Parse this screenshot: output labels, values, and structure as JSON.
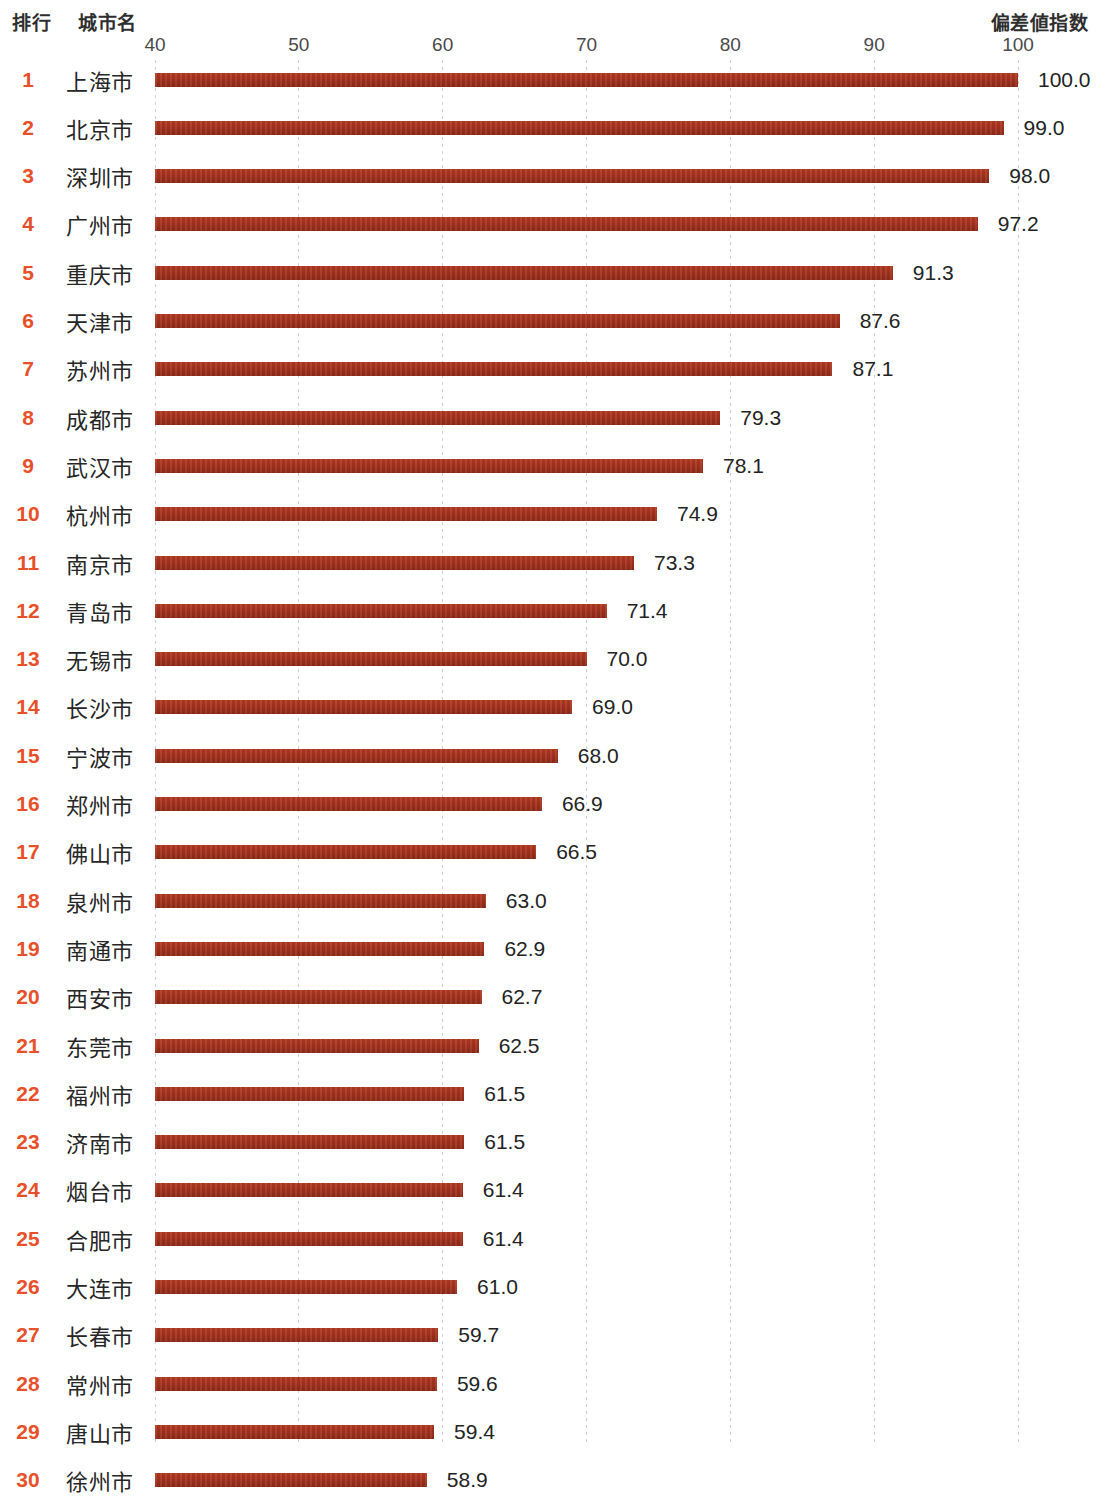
{
  "header": {
    "rank_label": "排行",
    "city_label": "城市名",
    "value_label": "偏差値指数"
  },
  "colors": {
    "bar": "#a8301e",
    "rank": "#e8502a",
    "text": "#262626",
    "gridline": "#c9c9c9"
  },
  "chart_data": {
    "type": "bar",
    "orientation": "horizontal",
    "title": "",
    "xlabel": "偏差値指数",
    "ylabel": "城市名",
    "xlim": [
      40,
      100
    ],
    "xticks": [
      40,
      50,
      60,
      70,
      80,
      90,
      100
    ],
    "xtick_labels": [
      "40",
      "50",
      "60",
      "70",
      "80",
      "90",
      "100"
    ],
    "grid": true,
    "legend": null,
    "categories": [
      "上海市",
      "北京市",
      "深圳市",
      "广州市",
      "重庆市",
      "天津市",
      "苏州市",
      "成都市",
      "武汉市",
      "杭州市",
      "南京市",
      "青岛市",
      "无锡市",
      "长沙市",
      "宁波市",
      "郑州市",
      "佛山市",
      "泉州市",
      "南通市",
      "西安市",
      "东莞市",
      "福州市",
      "济南市",
      "烟台市",
      "合肥市",
      "大连市",
      "长春市",
      "常州市",
      "唐山市",
      "徐州市"
    ],
    "values": [
      100.0,
      99.0,
      98.0,
      97.2,
      91.3,
      87.6,
      87.1,
      79.3,
      78.1,
      74.9,
      73.3,
      71.4,
      70.0,
      69.0,
      68.0,
      66.9,
      66.5,
      63.0,
      62.9,
      62.7,
      62.5,
      61.5,
      61.5,
      61.4,
      61.4,
      61.0,
      59.7,
      59.6,
      59.4,
      58.9
    ],
    "ranks": [
      "1",
      "2",
      "3",
      "4",
      "5",
      "6",
      "7",
      "8",
      "9",
      "10",
      "11",
      "12",
      "13",
      "14",
      "15",
      "16",
      "17",
      "18",
      "19",
      "20",
      "21",
      "22",
      "23",
      "24",
      "25",
      "26",
      "27",
      "28",
      "29",
      "30"
    ],
    "value_labels": [
      "100.0",
      "99.0",
      "98.0",
      "97.2",
      "91.3",
      "87.6",
      "87.1",
      "79.3",
      "78.1",
      "74.9",
      "73.3",
      "71.4",
      "70.0",
      "69.0",
      "68.0",
      "66.9",
      "66.5",
      "63.0",
      "62.9",
      "62.7",
      "62.5",
      "61.5",
      "61.5",
      "61.4",
      "61.4",
      "61.0",
      "59.7",
      "59.6",
      "59.4",
      "58.9"
    ]
  }
}
